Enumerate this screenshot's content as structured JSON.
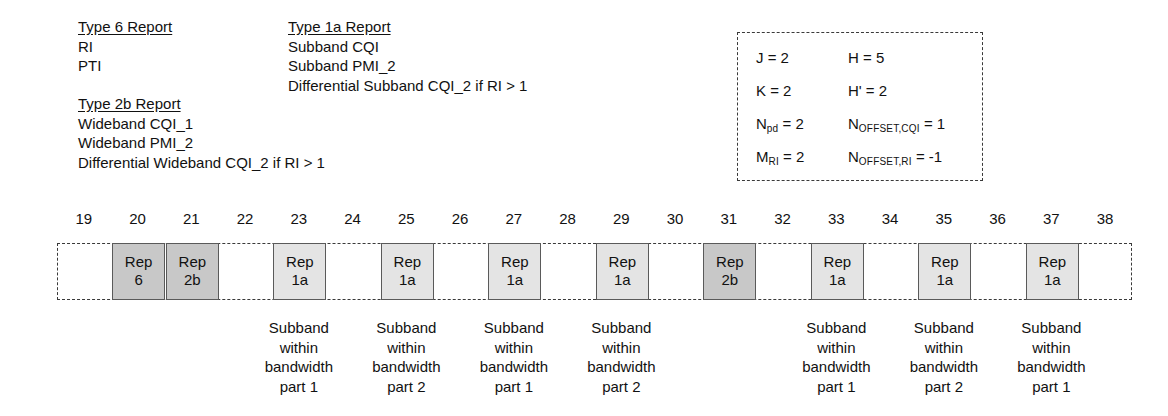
{
  "legend": {
    "type6": {
      "title": "Type 6 Report",
      "lines": [
        "RI",
        "PTI"
      ]
    },
    "type2b": {
      "title": "Type 2b Report",
      "lines": [
        "Wideband CQI_1",
        "Wideband PMI_2",
        "Differential Wideband CQI_2 if RI > 1"
      ]
    },
    "type1a": {
      "title": "Type 1a Report",
      "lines": [
        "Subband CQI",
        "Subband PMI_2",
        "Differential Subband CQI_2 if RI > 1"
      ]
    }
  },
  "parameters": [
    {
      "left_name": "J",
      "left_sub": "",
      "left_value": "2",
      "right_name": "H",
      "right_sub": "",
      "right_value": "5"
    },
    {
      "left_name": "K",
      "left_sub": "",
      "left_value": "2",
      "right_name": "H'",
      "right_sub": "",
      "right_value": "2"
    },
    {
      "left_name": "N",
      "left_sub": "pd",
      "left_value": "2",
      "right_name": "N",
      "right_sub": "OFFSET,CQI",
      "right_value": "1"
    },
    {
      "left_name": "M",
      "left_sub": "RI",
      "left_value": "2",
      "right_name": "N",
      "right_sub": "OFFSET,RI",
      "right_value": "-1"
    }
  ],
  "timeline": {
    "ticks": [
      19,
      20,
      21,
      22,
      23,
      24,
      25,
      26,
      27,
      28,
      29,
      30,
      31,
      32,
      33,
      34,
      35,
      36,
      37,
      38
    ],
    "reports": [
      {
        "tick": 20,
        "line1": "Rep",
        "line2": "6",
        "shade": "dark"
      },
      {
        "tick": 21,
        "line1": "Rep",
        "line2": "2b",
        "shade": "dark"
      },
      {
        "tick": 23,
        "line1": "Rep",
        "line2": "1a",
        "shade": "light"
      },
      {
        "tick": 25,
        "line1": "Rep",
        "line2": "1a",
        "shade": "light"
      },
      {
        "tick": 27,
        "line1": "Rep",
        "line2": "1a",
        "shade": "light"
      },
      {
        "tick": 29,
        "line1": "Rep",
        "line2": "1a",
        "shade": "light"
      },
      {
        "tick": 31,
        "line1": "Rep",
        "line2": "2b",
        "shade": "dark"
      },
      {
        "tick": 33,
        "line1": "Rep",
        "line2": "1a",
        "shade": "light"
      },
      {
        "tick": 35,
        "line1": "Rep",
        "line2": "1a",
        "shade": "light"
      },
      {
        "tick": 37,
        "line1": "Rep",
        "line2": "1a",
        "shade": "light"
      }
    ],
    "captions": [
      {
        "tick": 23,
        "lines": [
          "Subband",
          "within",
          "bandwidth",
          "part 1"
        ]
      },
      {
        "tick": 25,
        "lines": [
          "Subband",
          "within",
          "bandwidth",
          "part 2"
        ]
      },
      {
        "tick": 27,
        "lines": [
          "Subband",
          "within",
          "bandwidth",
          "part 1"
        ]
      },
      {
        "tick": 29,
        "lines": [
          "Subband",
          "within",
          "bandwidth",
          "part 2"
        ]
      },
      {
        "tick": 33,
        "lines": [
          "Subband",
          "within",
          "bandwidth",
          "part 1"
        ]
      },
      {
        "tick": 35,
        "lines": [
          "Subband",
          "within",
          "bandwidth",
          "part 2"
        ]
      },
      {
        "tick": 37,
        "lines": [
          "Subband",
          "within",
          "bandwidth",
          "part 1"
        ]
      }
    ]
  },
  "colors": {
    "shade_dark": "#c8c8c8",
    "shade_light": "#e4e4e4",
    "border": "#5a5a5a",
    "dashed": "#3a3a3a"
  }
}
